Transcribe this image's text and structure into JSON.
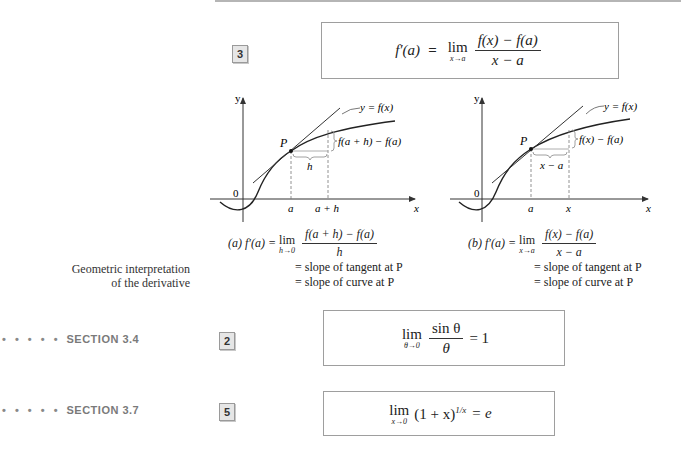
{
  "formula3": {
    "number": "3",
    "lhs": "f′(a)",
    "eq": "=",
    "lim": "lim",
    "lim_sub": "x→a",
    "numerator": "f(x) − f(a)",
    "denominator": "x − a"
  },
  "figure_a": {
    "y_axis": "y",
    "x_axis": "x",
    "origin": "0",
    "curve_label": "y = f(x)",
    "point": "P",
    "rise_label": "f(a + h) − f(a)",
    "run_label": "h",
    "tick1": "a",
    "tick2": "a + h",
    "caption": {
      "prefix": "(a) f′(a) =",
      "lim": "lim",
      "lim_sub": "h→0",
      "numerator": "f(a + h) − f(a)",
      "denominator": "h",
      "line2": "= slope of tangent at P",
      "line3": "= slope of curve at P"
    }
  },
  "figure_b": {
    "y_axis": "y",
    "x_axis": "x",
    "origin": "0",
    "curve_label": "y = f(x)",
    "point": "P",
    "rise_label": "f(x) − f(a)",
    "run_label": "x − a",
    "tick1": "a",
    "tick2": "x",
    "caption": {
      "prefix": "(b) f′(a) =",
      "lim": "lim",
      "lim_sub": "x→a",
      "numerator": "f(x) − f(a)",
      "denominator": "x − a",
      "line2": "= slope of tangent at P",
      "line3": "= slope of curve at P"
    }
  },
  "side_note": {
    "line1": "Geometric interpretation",
    "line2": "of the derivative"
  },
  "section_34": {
    "dots": "• • • • •",
    "label": "SECTION 3.4",
    "number": "2",
    "lim": "lim",
    "lim_sub": "θ→0",
    "numerator": "sin θ",
    "denominator": "θ",
    "rhs": "= 1"
  },
  "section_37": {
    "dots": "• • • • •",
    "label": "SECTION 3.7",
    "number": "5",
    "lim": "lim",
    "lim_sub": "x→0",
    "base": "(1 + x)",
    "exponent": "1/x",
    "rhs": "= e"
  }
}
